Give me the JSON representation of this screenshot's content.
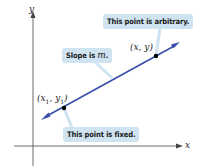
{
  "diagram": {
    "axes": {
      "x_label": "x",
      "y_label": "y"
    },
    "line": {
      "color": "#3a4fa8",
      "description": "line with arrowheads at both ends"
    },
    "points": [
      {
        "label_main": "(x",
        "sub1": "1",
        "mid": ", y",
        "sub2": "1",
        "end": ")",
        "note": "This point is fixed."
      },
      {
        "label": "(x, y)",
        "note": "This point is arbitrary."
      }
    ],
    "slope_callout": {
      "prefix": "Slope is ",
      "var": "m",
      "suffix": "."
    },
    "callout_color": "#cfe3f1"
  }
}
